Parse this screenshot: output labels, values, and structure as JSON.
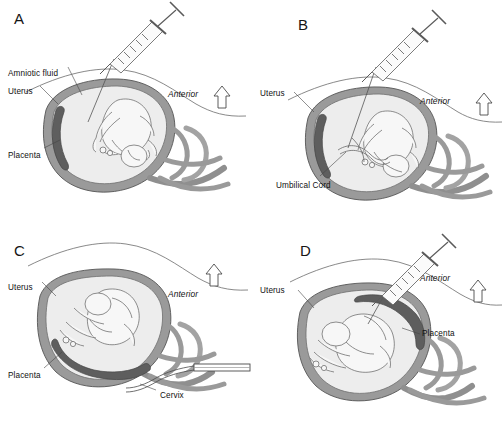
{
  "figure": {
    "background": "#ffffff",
    "colors": {
      "myometrium": "#9a9a9a",
      "myometrium_dark": "#7d7d7d",
      "placenta": "#5e5e5e",
      "amniotic_fluid": "#ededed",
      "fetus": "#f4f4f4",
      "outline": "#4a4a4a",
      "text": "#111111",
      "syringe_barrel": "#fbfbfb",
      "syringe_hub": "#b9b9b9"
    }
  },
  "panels": [
    {
      "id": "panel-a",
      "letter": "A",
      "instrument": "syringe-needle",
      "placenta_position": "posterior-fundal",
      "labels": [
        {
          "name": "amniotic-fluid",
          "text": "Amniotic fluid",
          "x": 8,
          "y": 70
        },
        {
          "name": "uterus",
          "text": "Uterus",
          "x": 8,
          "y": 88
        },
        {
          "name": "placenta",
          "text": "Placenta",
          "x": 8,
          "y": 152
        },
        {
          "name": "anterior",
          "text": "Anterior",
          "x": 168,
          "y": 90
        }
      ]
    },
    {
      "id": "panel-b",
      "letter": "B",
      "instrument": "syringe-needle",
      "placenta_position": "posterior-fundal",
      "labels": [
        {
          "name": "uterus",
          "text": "Uterus",
          "x": 8,
          "y": 90
        },
        {
          "name": "umbilical-cord",
          "text": "Umbilical Cord",
          "x": 24,
          "y": 182
        },
        {
          "name": "anterior",
          "text": "Anterior",
          "x": 168,
          "y": 97
        }
      ]
    },
    {
      "id": "panel-c",
      "letter": "C",
      "instrument": "transcervical-catheter",
      "placenta_position": "posterior-low-lying",
      "labels": [
        {
          "name": "uterus",
          "text": "Uterus",
          "x": 8,
          "y": 72
        },
        {
          "name": "placenta",
          "text": "Placenta",
          "x": 8,
          "y": 160
        },
        {
          "name": "cervix",
          "text": "Cervix",
          "x": 160,
          "y": 180
        },
        {
          "name": "anterior",
          "text": "Anterior",
          "x": 168,
          "y": 78
        }
      ]
    },
    {
      "id": "panel-d",
      "letter": "D",
      "instrument": "syringe-needle",
      "placenta_position": "anterior",
      "labels": [
        {
          "name": "uterus",
          "text": "Uterus",
          "x": 8,
          "y": 75
        },
        {
          "name": "placenta",
          "text": "Placenta",
          "x": 170,
          "y": 118
        },
        {
          "name": "anterior",
          "text": "Anterior",
          "x": 168,
          "y": 62
        }
      ]
    }
  ]
}
